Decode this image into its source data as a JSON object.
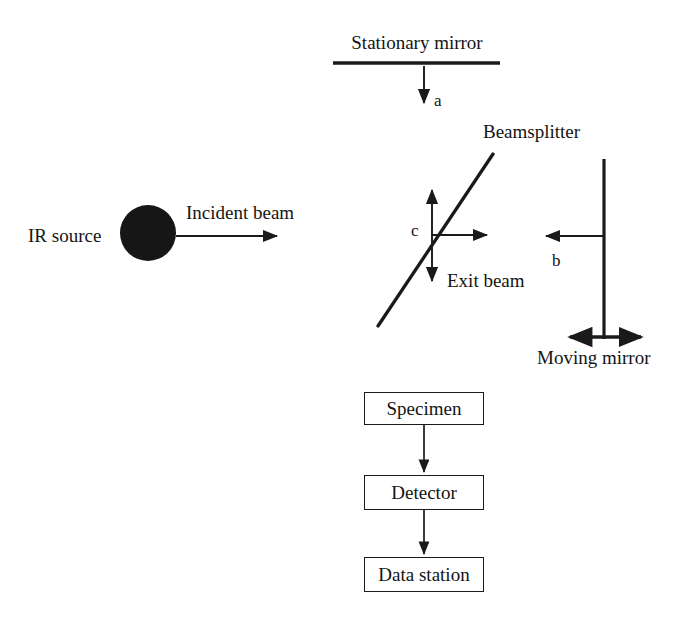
{
  "figure": {
    "type": "schematic-diagram",
    "background_color": "#ffffff",
    "line_color": "#1a1a1a",
    "text_color": "#141414"
  },
  "labels": {
    "stationary_mirror": "Stationary mirror",
    "beam_a": "a",
    "beamsplitter": "Beamsplitter",
    "ir_source": "IR source",
    "incident_beam": "Incident beam",
    "center_point_c": "c",
    "exit_beam": "Exit beam",
    "beam_b": "b",
    "moving_mirror": "Moving mirror"
  },
  "process_boxes": [
    {
      "label": "Specimen"
    },
    {
      "label": "Detector"
    },
    {
      "label": "Data station"
    }
  ],
  "geometry": {
    "stationary_mirror_line": {
      "x1": 333,
      "y1": 63,
      "x2": 500,
      "y2": 63
    },
    "beam_a_arrow": {
      "x1": 424,
      "y1": 68,
      "x2": 424,
      "y2": 104
    },
    "beamsplitter_line": {
      "x1": 378,
      "y1": 326,
      "x2": 493,
      "y2": 154
    },
    "cross_center": {
      "x": 432,
      "y": 235
    },
    "cross_vertical": {
      "x1": 432,
      "y1": 186,
      "x2": 432,
      "y2": 284
    },
    "cross_horizontal": {
      "x1": 432,
      "y1": 235,
      "x2": 489,
      "y2": 235
    },
    "ir_source_circle": {
      "cx": 148,
      "cy": 233,
      "r": 28
    },
    "incident_beam_arrow": {
      "x1": 176,
      "y1": 236,
      "x2": 278,
      "y2": 236
    },
    "moving_mirror_line": {
      "x1": 604,
      "y1": 159,
      "x2": 604,
      "y2": 339
    },
    "beam_b_arrow": {
      "x1": 604,
      "y1": 236,
      "x2": 544,
      "y2": 236
    },
    "moving_mirror_double_arrow": {
      "x1": 566,
      "y1": 337,
      "x2": 645,
      "y2": 337
    },
    "specimen_box": {
      "x": 364,
      "y": 392,
      "w": 120,
      "h": 33
    },
    "detector_box": {
      "x": 364,
      "y": 475,
      "w": 120,
      "h": 35
    },
    "data_station_box": {
      "x": 364,
      "y": 557,
      "w": 120,
      "h": 35
    },
    "arrow_specimen_to_detector": {
      "x1": 424,
      "y1": 425,
      "x2": 424,
      "y2": 473
    },
    "arrow_detector_to_data": {
      "x1": 424,
      "y1": 510,
      "x2": 424,
      "y2": 555
    }
  }
}
